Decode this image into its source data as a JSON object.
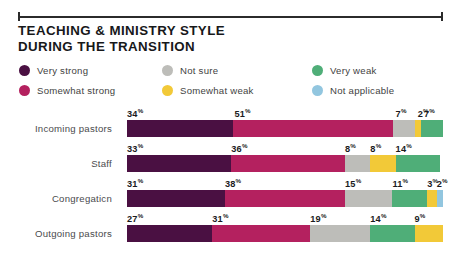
{
  "top_rule": {
    "present": true
  },
  "title": {
    "line1": "TEACHING & MINISTRY STYLE",
    "line2": "DURING THE TRANSITION"
  },
  "legend": {
    "items": [
      {
        "label": "Very strong",
        "color": "#4a1042",
        "key": "very_strong"
      },
      {
        "label": "Not sure",
        "color": "#bdbdb9",
        "key": "not_sure"
      },
      {
        "label": "Very weak",
        "color": "#4fae78",
        "key": "very_weak"
      },
      {
        "label": "Somewhat strong",
        "color": "#b4215f",
        "key": "somewhat_strong"
      },
      {
        "label": "Somewhat weak",
        "color": "#f2c938",
        "key": "somewhat_weak"
      },
      {
        "label": "Not applicable",
        "color": "#92c6df",
        "key": "not_applicable"
      }
    ]
  },
  "chart_data": {
    "type": "bar",
    "title": "TEACHING & MINISTRY STYLE DURING THE TRANSITION",
    "subtitle": "",
    "xlabel": "",
    "ylabel": "",
    "orientation": "horizontal",
    "stacked": true,
    "xlim": [
      0,
      100
    ],
    "grid": false,
    "legend_position": "top",
    "categories": [
      "Incoming pastors",
      "Staff",
      "Congregaticn",
      "Outgoing pastors"
    ],
    "series": [
      {
        "name": "Very strong",
        "color": "#4a1042",
        "values": [
          34,
          33,
          31,
          27
        ]
      },
      {
        "name": "Somewhat strong",
        "color": "#b4215f",
        "values": [
          51,
          36,
          38,
          31
        ]
      },
      {
        "name": "Not sure",
        "color": "#bdbdb9",
        "values": [
          7,
          8,
          15,
          19
        ]
      },
      {
        "name": "Somewhat weak",
        "color": "#f2c938",
        "values": [
          2,
          8,
          3,
          9
        ]
      },
      {
        "name": "Very weak",
        "color": "#4fae78",
        "values": [
          7,
          14,
          11,
          14
        ]
      },
      {
        "name": "Not applicable",
        "color": "#92c6df",
        "values": [
          0,
          0,
          2,
          0
        ]
      }
    ],
    "rows": [
      {
        "label": "Incoming pastors",
        "segments": [
          {
            "name": "Very strong",
            "value": 34,
            "color": "#4a1042",
            "label": "34"
          },
          {
            "name": "Somewhat strong",
            "value": 51,
            "color": "#b4215f",
            "label": "51"
          },
          {
            "name": "Not sure",
            "value": 7,
            "color": "#bdbdb9",
            "label": "7"
          },
          {
            "name": "Somewhat weak",
            "value": 2,
            "color": "#f2c938",
            "label": "2"
          },
          {
            "name": "Very weak",
            "value": 7,
            "color": "#4fae78",
            "label": "7"
          }
        ]
      },
      {
        "label": "Staff",
        "segments": [
          {
            "name": "Very strong",
            "value": 33,
            "color": "#4a1042",
            "label": "33"
          },
          {
            "name": "Somewhat strong",
            "value": 36,
            "color": "#b4215f",
            "label": "36"
          },
          {
            "name": "Not sure",
            "value": 8,
            "color": "#bdbdb9",
            "label": "8"
          },
          {
            "name": "Somewhat weak",
            "value": 8,
            "color": "#f2c938",
            "label": "8"
          },
          {
            "name": "Very weak",
            "value": 14,
            "color": "#4fae78",
            "label": "14"
          }
        ]
      },
      {
        "label": "Congregaticn",
        "segments": [
          {
            "name": "Very strong",
            "value": 31,
            "color": "#4a1042",
            "label": "31"
          },
          {
            "name": "Somewhat strong",
            "value": 38,
            "color": "#b4215f",
            "label": "38"
          },
          {
            "name": "Not sure",
            "value": 15,
            "color": "#bdbdb9",
            "label": "15"
          },
          {
            "name": "Very weak",
            "value": 11,
            "color": "#4fae78",
            "label": "11"
          },
          {
            "name": "Somewhat weak",
            "value": 3,
            "color": "#f2c938",
            "label": "3"
          },
          {
            "name": "Not applicable",
            "value": 2,
            "color": "#92c6df",
            "label": "2"
          }
        ]
      },
      {
        "label": "Outgoing pastors",
        "segments": [
          {
            "name": "Very strong",
            "value": 27,
            "color": "#4a1042",
            "label": "27"
          },
          {
            "name": "Somewhat strong",
            "value": 31,
            "color": "#b4215f",
            "label": "31"
          },
          {
            "name": "Not sure",
            "value": 19,
            "color": "#bdbdb9",
            "label": "19"
          },
          {
            "name": "Very weak",
            "value": 14,
            "color": "#4fae78",
            "label": "14"
          },
          {
            "name": "Somewhat weak",
            "value": 9,
            "color": "#f2c938",
            "label": "9"
          }
        ]
      }
    ],
    "percent_symbol": "%"
  }
}
